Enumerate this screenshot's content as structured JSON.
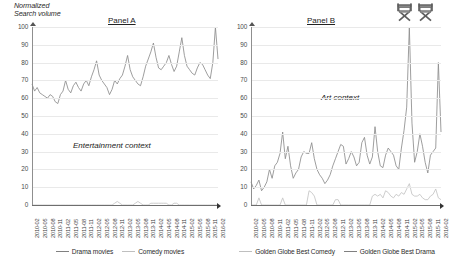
{
  "figure": {
    "y_axis_caption": "Normalized\nSearch volume",
    "chair_icon_1": "directors-chair-icon",
    "chair_icon_2": "directors-chair-icon"
  },
  "panel_a": {
    "title": "Panel A",
    "context_label": "Entertainment context",
    "legend": [
      {
        "label": "Drama movies",
        "color": "#808080"
      },
      {
        "label": "Comedy movies",
        "color": "#bfbfbf"
      }
    ]
  },
  "panel_b": {
    "title": "Panel B",
    "context_label": "Art context",
    "legend": [
      {
        "label": "Golden Globe Best Comedy",
        "color": "#bfbfbf"
      },
      {
        "label": "Golden Globe Best Drama",
        "color": "#808080"
      }
    ]
  },
  "chart_data": [
    {
      "id": "panel-a",
      "type": "line",
      "title": "Panel A",
      "xlabel": "",
      "ylabel": "Normalized Search volume",
      "ylim": [
        0,
        100
      ],
      "yticks": [
        0,
        10,
        20,
        30,
        40,
        50,
        60,
        70,
        80,
        90,
        100
      ],
      "grid": true,
      "legend_position": "bottom",
      "annotation": "Entertainment context",
      "x": [
        "2010-02",
        "2010-03",
        "2010-04",
        "2010-05",
        "2010-06",
        "2010-07",
        "2010-08",
        "2010-09",
        "2010-10",
        "2010-11",
        "2010-12",
        "2011-01",
        "2011-02",
        "2011-03",
        "2011-04",
        "2011-05",
        "2011-06",
        "2011-07",
        "2011-08",
        "2011-09",
        "2011-10",
        "2011-11",
        "2011-12",
        "2012-01",
        "2012-02",
        "2012-03",
        "2012-04",
        "2012-05",
        "2012-06",
        "2012-07",
        "2012-08",
        "2012-09",
        "2012-10",
        "2012-11",
        "2012-12",
        "2013-01",
        "2013-02",
        "2013-03",
        "2013-04",
        "2013-05",
        "2013-06",
        "2013-07",
        "2013-08",
        "2013-09",
        "2013-10",
        "2013-11",
        "2013-12",
        "2014-01",
        "2014-02",
        "2014-03",
        "2014-04",
        "2014-05",
        "2014-06",
        "2014-07",
        "2014-08",
        "2014-09",
        "2014-10",
        "2014-11",
        "2014-12",
        "2015-01",
        "2015-02",
        "2015-03",
        "2015-04",
        "2015-05",
        "2015-06",
        "2015-07",
        "2015-08",
        "2015-09",
        "2015-10",
        "2015-11",
        "2015-12",
        "2016-01",
        "2016-02"
      ],
      "xtick_labels": [
        "2010-02",
        "2010-05",
        "2010-08",
        "2010-11",
        "2011-02",
        "2011-05",
        "2011-08",
        "2011-11",
        "2012-02",
        "2012-05",
        "2012-08",
        "2012-11",
        "2013-02",
        "2013-05",
        "2013-08",
        "2013-11",
        "2014-02",
        "2014-05",
        "2014-08",
        "2014-11",
        "2015-02",
        "2015-05",
        "2015-08",
        "2015-11",
        "2016-02"
      ],
      "series": [
        {
          "name": "Drama movies",
          "color": "#8c8c8c",
          "values": [
            68,
            64,
            66,
            63,
            62,
            61,
            60,
            62,
            61,
            58,
            57,
            62,
            64,
            70,
            65,
            63,
            67,
            69,
            66,
            64,
            68,
            70,
            67,
            72,
            76,
            81,
            73,
            70,
            68,
            66,
            62,
            65,
            70,
            68,
            71,
            73,
            78,
            84,
            76,
            72,
            70,
            68,
            67,
            72,
            78,
            82,
            86,
            91,
            83,
            77,
            76,
            78,
            80,
            84,
            79,
            75,
            78,
            86,
            94,
            84,
            78,
            76,
            74,
            73,
            77,
            80,
            79,
            76,
            73,
            71,
            80,
            100,
            82
          ]
        },
        {
          "name": "Comedy movies",
          "color": "#c4c4c4",
          "values": [
            0,
            0,
            0,
            0,
            0,
            0,
            0,
            0,
            0,
            0,
            0,
            0,
            0,
            0,
            0,
            0,
            0,
            0,
            0,
            0,
            0,
            0,
            0,
            0,
            0,
            0,
            0,
            0,
            0,
            0,
            0,
            0,
            1,
            2,
            1,
            0,
            0,
            0,
            0,
            0,
            1,
            2,
            1,
            0,
            0,
            0,
            1,
            1,
            1,
            1,
            1,
            1,
            1,
            0,
            0,
            1,
            1,
            0,
            0,
            0,
            0,
            0,
            0,
            0,
            0,
            0,
            0,
            0,
            0,
            0,
            0,
            0,
            0
          ]
        }
      ]
    },
    {
      "id": "panel-b",
      "type": "line",
      "title": "Panel B",
      "xlabel": "",
      "ylabel": "Normalized Search volume",
      "ylim": [
        0,
        100
      ],
      "yticks": [
        0,
        10,
        20,
        30,
        40,
        50,
        60,
        70,
        80,
        90,
        100
      ],
      "grid": true,
      "legend_position": "bottom",
      "annotation": "Art context",
      "x": [
        "2010-02",
        "2010-03",
        "2010-04",
        "2010-05",
        "2010-06",
        "2010-07",
        "2010-08",
        "2010-09",
        "2010-10",
        "2010-11",
        "2010-12",
        "2011-01",
        "2011-02",
        "2011-03",
        "2011-04",
        "2011-05",
        "2011-06",
        "2011-07",
        "2011-08",
        "2011-09",
        "2011-10",
        "2011-11",
        "2011-12",
        "2012-01",
        "2012-02",
        "2012-03",
        "2012-04",
        "2012-05",
        "2012-06",
        "2012-07",
        "2012-08",
        "2012-09",
        "2012-10",
        "2012-11",
        "2012-12",
        "2013-01",
        "2013-02",
        "2013-03",
        "2013-04",
        "2013-05",
        "2013-06",
        "2013-07",
        "2013-08",
        "2013-09",
        "2013-10",
        "2013-11",
        "2013-12",
        "2014-01",
        "2014-02",
        "2014-03",
        "2014-04",
        "2014-05",
        "2014-06",
        "2014-07",
        "2014-08",
        "2014-09",
        "2014-10",
        "2014-11",
        "2014-12",
        "2015-01",
        "2015-02",
        "2015-03",
        "2015-04",
        "2015-05",
        "2015-06",
        "2015-07",
        "2015-08",
        "2015-09",
        "2015-10",
        "2015-11",
        "2015-12",
        "2016-01",
        "2016-02"
      ],
      "xtick_labels": [
        "2010-02",
        "2010-05",
        "2010-08",
        "2010-11",
        "2011-02",
        "2011-05",
        "2011-08",
        "2011-11",
        "2012-02",
        "2012-05",
        "2012-08",
        "2012-11",
        "2013-02",
        "2013-05",
        "2013-08",
        "2013-11",
        "2014-02",
        "2014-05",
        "2014-08",
        "2014-11",
        "2015-02",
        "2015-05",
        "2015-08",
        "2015-11",
        "2016-02"
      ],
      "series": [
        {
          "name": "Golden Globe Best Drama",
          "color": "#8c8c8c",
          "values": [
            13,
            9,
            11,
            14,
            8,
            10,
            13,
            20,
            15,
            22,
            24,
            29,
            41,
            26,
            33,
            22,
            15,
            18,
            20,
            27,
            30,
            29,
            29,
            35,
            26,
            20,
            17,
            15,
            12,
            14,
            17,
            22,
            26,
            30,
            34,
            33,
            23,
            26,
            30,
            27,
            22,
            24,
            35,
            38,
            28,
            23,
            27,
            44,
            30,
            22,
            21,
            28,
            32,
            30,
            28,
            22,
            20,
            32,
            42,
            55,
            100,
            46,
            24,
            30,
            40,
            33,
            24,
            18,
            28,
            30,
            32,
            80,
            41
          ]
        },
        {
          "name": "Golden Globe Best Comedy",
          "color": "#c4c4c4",
          "values": [
            0,
            0,
            0,
            4,
            0,
            0,
            0,
            0,
            0,
            0,
            0,
            0,
            4,
            0,
            0,
            0,
            0,
            0,
            0,
            0,
            0,
            0,
            8,
            7,
            5,
            0,
            0,
            0,
            0,
            0,
            0,
            0,
            3,
            3,
            0,
            0,
            0,
            0,
            0,
            0,
            0,
            0,
            0,
            0,
            0,
            0,
            5,
            6,
            5,
            6,
            4,
            8,
            7,
            5,
            4,
            6,
            5,
            7,
            6,
            9,
            12,
            6,
            5,
            5,
            6,
            4,
            3,
            3,
            5,
            6,
            9,
            4,
            3
          ]
        }
      ]
    }
  ]
}
